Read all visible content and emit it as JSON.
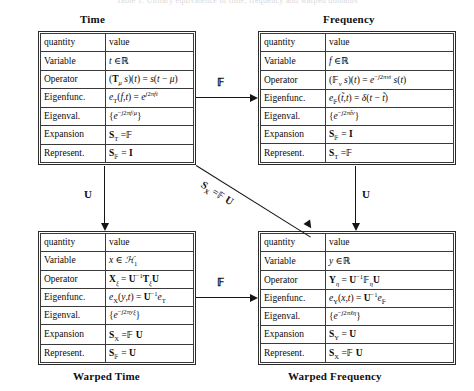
{
  "caption_remnant": "Table 1.  Unitary equivalence of time, frequency and warped domains",
  "panels": {
    "time": {
      "title": "Time",
      "title_position": "top",
      "header": {
        "key": "quantity",
        "value": "value"
      },
      "rows": [
        {
          "key": "Variable",
          "value": "t ∈ ℝ"
        },
        {
          "key": "Operator",
          "value": "(Tμ s)(t) = s(t − μ)"
        },
        {
          "key": "Eigenfunc.",
          "value": "eᴛ(f, t) = e^{j2πft}"
        },
        {
          "key": "Eigenval.",
          "value": "{ e^{−j2πfμ} }"
        },
        {
          "key": "Expansion",
          "value": "Sᴛ = 𝔽"
        },
        {
          "key": "Represent.",
          "value": "Sꜰ = I"
        }
      ]
    },
    "frequency": {
      "title": "Frequency",
      "title_position": "top",
      "header": {
        "key": "quantity",
        "value": "value"
      },
      "rows": [
        {
          "key": "Variable",
          "value": "f ∈ ℝ"
        },
        {
          "key": "Operator",
          "value": "(Fν s)(t) = e^{−j2πνt} s(t)"
        },
        {
          "key": "Eigenfunc.",
          "value": "eꜰ(t̃, t) = δ(t − t̃)"
        },
        {
          "key": "Eigenval.",
          "value": "{ e^{−j2πt̃ν} }"
        },
        {
          "key": "Expansion",
          "value": "Sꜰ = I"
        },
        {
          "key": "Represent.",
          "value": "Sᴛ = 𝔽"
        }
      ]
    },
    "warped_time": {
      "title": "Warped Time",
      "title_position": "bottom",
      "header": {
        "key": "quantity",
        "value": "value"
      },
      "rows": [
        {
          "key": "Variable",
          "value": "x ∈ ℋ₁"
        },
        {
          "key": "Operator",
          "value": "Xξ = U⁻¹ Tξ U"
        },
        {
          "key": "Eigenfunc.",
          "value": "eₓ(y, t) = U⁻¹ eᴛ"
        },
        {
          "key": "Eigenval.",
          "value": "{ e^{−j2πyξ} }"
        },
        {
          "key": "Expansion",
          "value": "Sₓ = 𝔽 U"
        },
        {
          "key": "Represent.",
          "value": "Sꜰ = U"
        }
      ]
    },
    "warped_frequency": {
      "title": "Warped Frequency",
      "title_position": "bottom",
      "header": {
        "key": "quantity",
        "value": "value"
      },
      "rows": [
        {
          "key": "Variable",
          "value": "y ∈ ℝ"
        },
        {
          "key": "Operator",
          "value": "Yη = U⁻¹ Fη U"
        },
        {
          "key": "Eigenfunc.",
          "value": "eʏ(x, t) = U⁻¹ eꜰ"
        },
        {
          "key": "Eigenval.",
          "value": "{ e^{−j2πx̃η} }"
        },
        {
          "key": "Expansion",
          "value": "Sʏ = U"
        },
        {
          "key": "Represent.",
          "value": "Sₓ = 𝔽 U"
        }
      ]
    }
  },
  "arrows": {
    "top_horizontal": {
      "label": "𝔽",
      "from": "time",
      "to": "frequency"
    },
    "bottom_horizontal": {
      "label": "𝔽",
      "from": "warped_time",
      "to": "warped_frequency"
    },
    "left_vertical": {
      "label": "U",
      "from": "time",
      "to": "warped_time"
    },
    "right_vertical": {
      "label": "U",
      "from": "frequency",
      "to": "warped_frequency"
    },
    "diagonal": {
      "label": "Sₓ = 𝔽 U",
      "from": "time",
      "to": "warped_frequency"
    }
  }
}
